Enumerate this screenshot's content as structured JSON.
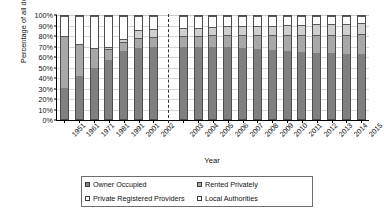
{
  "chart_data": {
    "type": "bar",
    "stacked": true,
    "title": "",
    "xlabel": "Year",
    "ylabel": "Percentage of all dwellings",
    "ylim": [
      0,
      100
    ],
    "yticks": [
      "0%",
      "10%",
      "20%",
      "30%",
      "40%",
      "50%",
      "60%",
      "70%",
      "80%",
      "90%",
      "100%"
    ],
    "grid": true,
    "legend_position": "bottom",
    "categories": [
      "1951",
      "1961",
      "1971",
      "1981",
      "1991",
      "2001",
      "2002",
      "",
      "2003",
      "2004",
      "2005",
      "2006",
      "2007",
      "2008",
      "2009",
      "2010",
      "2011",
      "2012",
      "2013",
      "2014",
      "2015"
    ],
    "group_break_after": "2002",
    "series": [
      {
        "name": "Owner Occupied",
        "color": "#808080",
        "values": [
          30,
          42,
          50,
          57,
          66,
          69,
          70,
          null,
          70,
          70,
          70,
          70,
          69,
          68,
          67,
          66,
          65,
          64,
          64,
          63,
          63
        ]
      },
      {
        "name": "Rented Privately",
        "color": "#a8a8a8",
        "values": [
          51,
          31,
          19,
          11,
          9,
          10,
          10,
          null,
          11,
          11,
          12,
          12,
          13,
          14,
          15,
          16,
          17,
          18,
          18,
          19,
          20
        ]
      },
      {
        "name": "Private Registered Providers",
        "color": "#ffffff",
        "values": [
          0,
          0,
          0,
          2,
          3,
          7,
          7,
          null,
          7,
          7,
          7,
          8,
          8,
          8,
          8,
          9,
          9,
          10,
          10,
          10,
          10
        ]
      },
      {
        "name": "Local Authorities",
        "color": "#ffffff",
        "values": [
          19,
          27,
          31,
          30,
          22,
          14,
          13,
          null,
          12,
          12,
          11,
          10,
          10,
          10,
          10,
          9,
          9,
          8,
          8,
          8,
          7
        ]
      }
    ]
  },
  "legend": {
    "items": [
      {
        "label": "Owner Occupied",
        "swatch": "dark-gray"
      },
      {
        "label": "Rented Privately",
        "swatch": "medium-gray"
      },
      {
        "label": "Private Registered Providers",
        "swatch": "white"
      },
      {
        "label": "Local Authorities",
        "swatch": "white"
      }
    ]
  }
}
